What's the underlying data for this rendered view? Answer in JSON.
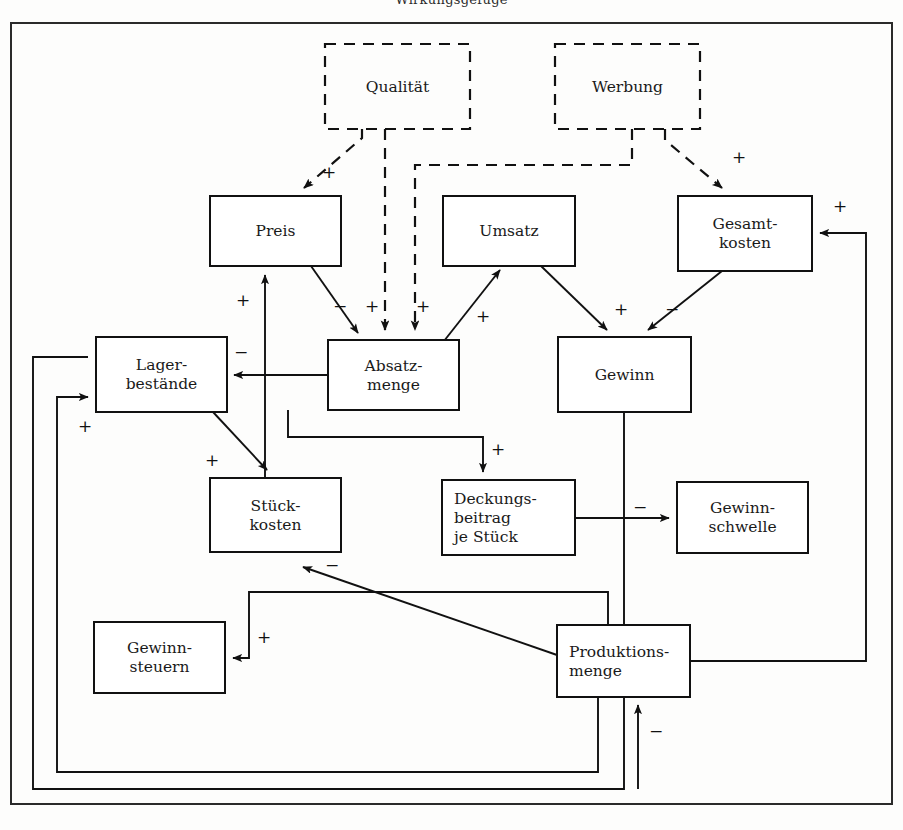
{
  "page": {
    "title_fragment": "Wirkungsgefüge",
    "background": "#fdfdfc",
    "ink": "#111111",
    "width": 903,
    "height": 830
  },
  "diagram": {
    "type": "causal-loop-diagram",
    "language": "de",
    "frame": {
      "x": 10,
      "y": 22,
      "w": 883,
      "h": 783
    },
    "nodes": [
      {
        "id": "qualitaet",
        "label": "Qualität",
        "lines": [
          "Qualität"
        ],
        "style": "dashed",
        "align": "center",
        "x": 325,
        "y": 44,
        "w": 145,
        "h": 85
      },
      {
        "id": "werbung",
        "label": "Werbung",
        "lines": [
          "Werbung"
        ],
        "style": "dashed",
        "align": "center",
        "x": 555,
        "y": 44,
        "w": 145,
        "h": 85
      },
      {
        "id": "preis",
        "label": "Preis",
        "lines": [
          "Preis"
        ],
        "style": "solid",
        "align": "center",
        "x": 210,
        "y": 196,
        "w": 131,
        "h": 70
      },
      {
        "id": "umsatz",
        "label": "Umsatz",
        "lines": [
          "Umsatz"
        ],
        "style": "solid",
        "align": "center",
        "x": 443,
        "y": 196,
        "w": 132,
        "h": 70
      },
      {
        "id": "gesamtkosten",
        "label": "Gesamtkosten",
        "lines": [
          "Gesamt-",
          "kosten"
        ],
        "style": "solid",
        "align": "center",
        "x": 678,
        "y": 196,
        "w": 134,
        "h": 75
      },
      {
        "id": "absatzmenge",
        "label": "Absatzmenge",
        "lines": [
          "Absatz-",
          "menge"
        ],
        "style": "solid",
        "align": "center",
        "x": 328,
        "y": 340,
        "w": 131,
        "h": 70
      },
      {
        "id": "lagerbestaende",
        "label": "Lagerbestände",
        "lines": [
          "Lager-",
          "bestände"
        ],
        "style": "solid",
        "align": "center",
        "x": 96,
        "y": 337,
        "w": 131,
        "h": 75
      },
      {
        "id": "gewinn",
        "label": "Gewinn",
        "lines": [
          "Gewinn"
        ],
        "style": "solid",
        "align": "center",
        "x": 558,
        "y": 337,
        "w": 133,
        "h": 75
      },
      {
        "id": "stueckkosten",
        "label": "Stückkosten",
        "lines": [
          "Stück-",
          "kosten"
        ],
        "style": "solid",
        "align": "center",
        "x": 210,
        "y": 478,
        "w": 131,
        "h": 74
      },
      {
        "id": "deckungsbeitrag",
        "label": "Deckungsbeitrag je Stück",
        "lines": [
          "Deckungs-",
          "beitrag",
          "je Stück"
        ],
        "style": "solid",
        "align": "left",
        "x": 442,
        "y": 480,
        "w": 133,
        "h": 75
      },
      {
        "id": "gewinnschwelle",
        "label": "Gewinnschwelle",
        "lines": [
          "Gewinn-",
          "schwelle"
        ],
        "style": "solid",
        "align": "center",
        "x": 677,
        "y": 482,
        "w": 131,
        "h": 71
      },
      {
        "id": "gewinnsteuern",
        "label": "Gewinnsteuern",
        "lines": [
          "Gewinn-",
          "steuern"
        ],
        "style": "solid",
        "align": "center",
        "x": 94,
        "y": 622,
        "w": 131,
        "h": 71
      },
      {
        "id": "produktionsmenge",
        "label": "Produktionsmenge",
        "lines": [
          "Produktions-",
          "menge"
        ],
        "style": "solid",
        "align": "left",
        "x": 557,
        "y": 625,
        "w": 133,
        "h": 72
      }
    ],
    "edges": [
      {
        "from": "qualitaet",
        "to": "preis",
        "sign": "+",
        "style": "dashed"
      },
      {
        "from": "qualitaet",
        "to": "absatzmenge",
        "sign": "+",
        "style": "dashed"
      },
      {
        "from": "werbung",
        "to": "absatzmenge",
        "sign": "+",
        "style": "dashed"
      },
      {
        "from": "werbung",
        "to": "gesamtkosten",
        "sign": "+",
        "style": "dashed"
      },
      {
        "from": "preis",
        "to": "absatzmenge",
        "sign": "−",
        "style": "solid"
      },
      {
        "from": "absatzmenge",
        "to": "umsatz",
        "sign": "+",
        "style": "solid"
      },
      {
        "from": "absatzmenge",
        "to": "lagerbestaende",
        "sign": "−",
        "style": "solid"
      },
      {
        "from": "umsatz",
        "to": "gewinn",
        "sign": "+",
        "style": "solid"
      },
      {
        "from": "gesamtkosten",
        "to": "gewinn",
        "sign": "−",
        "style": "solid"
      },
      {
        "from": "stueckkosten",
        "to": "preis",
        "sign": "+",
        "style": "solid"
      },
      {
        "from": "lagerbestaende",
        "to": "stueckkosten",
        "sign": "+",
        "style": "solid"
      },
      {
        "from": "absatzmenge",
        "to": "deckungsbeitrag",
        "sign": "+",
        "style": "solid"
      },
      {
        "from": "deckungsbeitrag",
        "to": "gewinnschwelle",
        "sign": "−",
        "style": "solid"
      },
      {
        "from": "produktionsmenge",
        "to": "stueckkosten",
        "sign": "−",
        "style": "solid"
      },
      {
        "from": "produktionsmenge",
        "to": "gewinnsteuern",
        "sign": "+",
        "style": "solid"
      },
      {
        "from": "produktionsmenge",
        "to": "gesamtkosten",
        "sign": "+",
        "style": "solid"
      },
      {
        "from": "produktionsmenge",
        "to": "lagerbestaende",
        "sign": "+",
        "style": "solid"
      },
      {
        "from": "gewinn",
        "to": "produktionsmenge",
        "sign": "−",
        "style": "solid"
      }
    ],
    "sign_labels": [
      {
        "id": "sign-qualitaet-preis",
        "text": "+",
        "x": 329,
        "y": 178
      },
      {
        "id": "sign-qualitaet-absatz",
        "text": "+",
        "x": 372,
        "y": 312
      },
      {
        "id": "sign-werbung-absatz",
        "text": "+",
        "x": 423,
        "y": 312
      },
      {
        "id": "sign-werbung-gesamtkosten",
        "text": "+",
        "x": 739,
        "y": 163
      },
      {
        "id": "sign-preis-absatz",
        "text": "−",
        "x": 340,
        "y": 312
      },
      {
        "id": "sign-absatz-umsatz",
        "text": "+",
        "x": 483,
        "y": 322
      },
      {
        "id": "sign-absatz-lager",
        "text": "−",
        "x": 241,
        "y": 358
      },
      {
        "id": "sign-umsatz-gewinn",
        "text": "+",
        "x": 621,
        "y": 315
      },
      {
        "id": "sign-gesamtkosten-gewinn",
        "text": "−",
        "x": 672,
        "y": 315
      },
      {
        "id": "sign-stueck-preis",
        "text": "+",
        "x": 243,
        "y": 306
      },
      {
        "id": "sign-lager-stueck",
        "text": "+",
        "x": 212,
        "y": 466
      },
      {
        "id": "sign-absatz-deckung",
        "text": "+",
        "x": 498,
        "y": 455
      },
      {
        "id": "sign-deckung-schwelle",
        "text": "−",
        "x": 640,
        "y": 513
      },
      {
        "id": "sign-produktion-stueck",
        "text": "−",
        "x": 332,
        "y": 571
      },
      {
        "id": "sign-produktion-steuern",
        "text": "+",
        "x": 264,
        "y": 643
      },
      {
        "id": "sign-produktion-gesamt",
        "text": "+",
        "x": 840,
        "y": 212
      },
      {
        "id": "sign-produktion-lager",
        "text": "+",
        "x": 85,
        "y": 432
      },
      {
        "id": "sign-gewinn-produktion",
        "text": "−",
        "x": 656,
        "y": 737
      }
    ]
  }
}
